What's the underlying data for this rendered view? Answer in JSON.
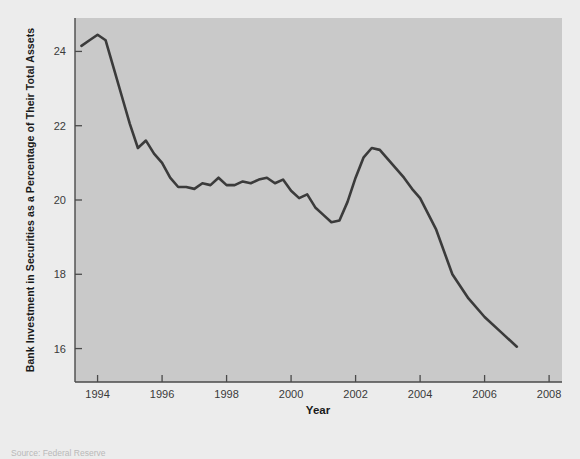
{
  "source_note": "Source: Federal Reserve",
  "chart_data": {
    "type": "line",
    "title": "",
    "xlabel": "Year",
    "ylabel": "Bank Investment in Securities as a Percentage of Their Total Assets",
    "xlim": [
      1993.3,
      2008.4
    ],
    "ylim": [
      15.1,
      24.9
    ],
    "xticks": [
      1994,
      1996,
      1998,
      2000,
      2002,
      2004,
      2006,
      2008
    ],
    "xtick_labels": [
      "1994",
      "1996",
      "1998",
      "2000",
      "2002",
      "2004",
      "2006",
      "2008"
    ],
    "yticks": [
      16,
      18,
      20,
      22,
      24
    ],
    "ytick_labels": [
      "16",
      "18",
      "20",
      "22",
      "24"
    ],
    "grid": false,
    "legend": "none",
    "line_color": "#3b3b3b",
    "plot_bg_color": "#c9c9c9",
    "figure_bg_color": "#ececec",
    "series": [
      {
        "name": "Bank Investment in Securities",
        "x": [
          1993.5,
          1993.75,
          1994.0,
          1994.25,
          1994.5,
          1994.75,
          1995.0,
          1995.25,
          1995.5,
          1995.75,
          1996.0,
          1996.25,
          1996.5,
          1996.75,
          1997.0,
          1997.25,
          1997.5,
          1997.75,
          1998.0,
          1998.25,
          1998.5,
          1998.75,
          1999.0,
          1999.25,
          1999.5,
          1999.75,
          2000.0,
          2000.25,
          2000.5,
          2000.75,
          2001.0,
          2001.25,
          2001.5,
          2001.75,
          2002.0,
          2002.25,
          2002.5,
          2002.75,
          2003.0,
          2003.25,
          2003.5,
          2003.75,
          2004.0,
          2004.5,
          2005.0,
          2005.5,
          2006.0,
          2006.5,
          2007.0
        ],
        "y": [
          24.15,
          24.3,
          24.45,
          24.3,
          23.55,
          22.8,
          22.05,
          21.4,
          21.6,
          21.25,
          21.0,
          20.6,
          20.35,
          20.35,
          20.3,
          20.45,
          20.4,
          20.6,
          20.4,
          20.4,
          20.5,
          20.45,
          20.55,
          20.6,
          20.45,
          20.55,
          20.25,
          20.05,
          20.15,
          19.8,
          19.6,
          19.4,
          19.45,
          19.95,
          20.6,
          21.15,
          21.4,
          21.35,
          21.1,
          20.85,
          20.6,
          20.3,
          20.05,
          19.2,
          18.0,
          17.35,
          16.85,
          16.45,
          16.05
        ]
      }
    ]
  }
}
